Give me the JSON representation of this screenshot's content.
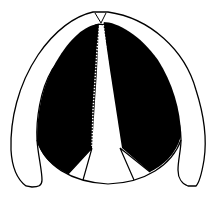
{
  "figure": {
    "title": "",
    "colors": {
      "fill_dark": "#000000",
      "fill_light": "#ffffff",
      "stroke": "#000000"
    }
  }
}
